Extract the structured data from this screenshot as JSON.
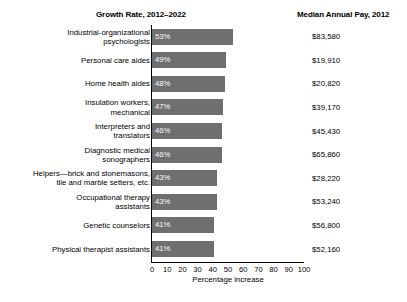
{
  "headers": {
    "growth": "Growth Rate, 2012–2022",
    "pay": "Median Annual Pay, 2012"
  },
  "axis": {
    "title": "Percentage increase",
    "ticks": [
      "0",
      "10",
      "20",
      "30",
      "40",
      "50",
      "60",
      "70",
      "80",
      "90",
      "100"
    ]
  },
  "colors": {
    "bar": "#6f6f6f",
    "value_text": "#ffffff",
    "axis": "#000000"
  },
  "chart_data": {
    "type": "bar",
    "orientation": "horizontal",
    "title": "Growth Rate, 2012–2022",
    "xlabel": "Percentage increase",
    "ylabel": "",
    "xlim": [
      0,
      100
    ],
    "grid": false,
    "legend": "none",
    "categories": [
      "Industrial-organizational psychologists",
      "Personal care aides",
      "Home health aides",
      "Insulation workers, mechanical",
      "Interpreters and translators",
      "Diagnostic medical sonographers",
      "Helpers—brick and stonemasons, tile and marble setters, etc.",
      "Occupational therapy assistants",
      "Genetic counselors",
      "Physical therapist assistants"
    ],
    "values": [
      53,
      49,
      48,
      47,
      46,
      46,
      43,
      43,
      41,
      41
    ],
    "value_labels": [
      "53%",
      "49%",
      "48%",
      "47%",
      "46%",
      "46%",
      "43%",
      "43%",
      "41%",
      "41%"
    ],
    "secondary_series": {
      "name": "Median Annual Pay, 2012",
      "labels": [
        "$83,580",
        "$19,910",
        "$20,820",
        "$39,170",
        "$45,430",
        "$65,860",
        "$28,220",
        "$53,240",
        "$56,800",
        "$52,160"
      ],
      "values": [
        83580,
        19910,
        20820,
        39170,
        45430,
        65860,
        28220,
        53240,
        56800,
        52160
      ]
    }
  },
  "rows": [
    {
      "label_lines": [
        "Industrial-organizational",
        "psychologists"
      ],
      "value": 53,
      "value_label": "53%",
      "pay": "$83,580"
    },
    {
      "label_lines": [
        "Personal care aides"
      ],
      "value": 49,
      "value_label": "49%",
      "pay": "$19,910"
    },
    {
      "label_lines": [
        "Home health aides"
      ],
      "value": 48,
      "value_label": "48%",
      "pay": "$20,820"
    },
    {
      "label_lines": [
        "Insulation workers,",
        "mechanical"
      ],
      "value": 47,
      "value_label": "47%",
      "pay": "$39,170"
    },
    {
      "label_lines": [
        "Interpreters and",
        "translators"
      ],
      "value": 46,
      "value_label": "46%",
      "pay": "$45,430"
    },
    {
      "label_lines": [
        "Diagnostic medical",
        "sonographers"
      ],
      "value": 46,
      "value_label": "46%",
      "pay": "$65,860"
    },
    {
      "label_lines": [
        "Helpers—brick and stonemasons,",
        "tile and marble setters, etc."
      ],
      "value": 43,
      "value_label": "43%",
      "pay": "$28,220"
    },
    {
      "label_lines": [
        "Occupational therapy",
        "assistants"
      ],
      "value": 43,
      "value_label": "43%",
      "pay": "$53,240"
    },
    {
      "label_lines": [
        "Genetic counselors"
      ],
      "value": 41,
      "value_label": "41%",
      "pay": "$56,800"
    },
    {
      "label_lines": [
        "Physical therapist assistants"
      ],
      "value": 41,
      "value_label": "41%",
      "pay": "$52,160"
    }
  ]
}
